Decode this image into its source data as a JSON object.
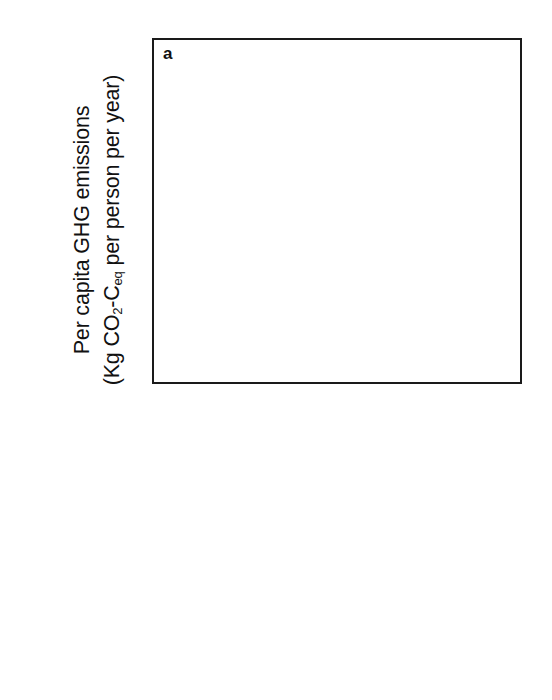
{
  "chart_data": {
    "type": "bar",
    "variant": "stacked",
    "panel_label": "a",
    "title": "",
    "xlabel": "",
    "ylabel_line1": "Per capita GHG emissions",
    "ylabel_line2_pre": "(Kg CO",
    "ylabel_line2_sub1": "2",
    "ylabel_line2_mid": "-C",
    "ylabel_line2_sub2": "eq",
    "ylabel_line2_post": " per person per year)",
    "ylabel_full": "Per capita GHG emissions (Kg CO2-Ceq per person per year)",
    "ylim": [
      0,
      450
    ],
    "yticks": [
      0,
      100,
      200,
      300,
      400
    ],
    "ytick_labels": [
      "0",
      "100",
      "200",
      "300",
      "400"
    ],
    "grid": false,
    "legend_position": "below-plot",
    "categories": [
      "2009",
      "Income-dependent 2050",
      "Mediterranean",
      "Pescetarian",
      "Vegetarian"
    ],
    "series": [
      {
        "name": "Empty calories",
        "color": "#6b6b6b",
        "values": [
          28,
          52,
          25,
          26,
          27
        ]
      },
      {
        "name": "Cereals",
        "color": "#c9c9c9",
        "values": [
          66,
          55,
          40,
          40,
          42
        ]
      },
      {
        "name": "Fruits/vegetables",
        "color": "#2a2a2a",
        "values": [
          39,
          37,
          70,
          49,
          44
        ]
      },
      {
        "name": "Roots",
        "color": "#848484",
        "values": [
          20,
          0,
          0,
          0,
          0
        ]
      },
      {
        "name": "Nuts/pulses",
        "color": "#d8d8d8",
        "values": [
          20,
          95,
          52,
          0,
          0
        ]
      },
      {
        "name": "Dairy/eggs",
        "color": "#5d5d5d",
        "values": [
          26,
          63,
          50,
          60,
          77
        ]
      },
      {
        "name": "Seafood",
        "color": "#9a9a9a",
        "values": [
          18,
          27,
          41,
          59,
          0
        ]
      },
      {
        "name": "Pork",
        "color": "#6e6e6e",
        "values": [
          0,
          26,
          7,
          0,
          0
        ]
      },
      {
        "name": "Poultry",
        "color": "#b5b5b5",
        "values": [
          0,
          22,
          9,
          0,
          0
        ]
      },
      {
        "name": "Ruminant",
        "color": "#4a4a4a",
        "values": [
          116,
          68,
          17,
          0,
          0
        ]
      }
    ],
    "totals": [
      333,
      445,
      311,
      234,
      190
    ]
  },
  "legend": {
    "columns": [
      [
        {
          "label": "Ruminant",
          "color": "#4a4a4a",
          "swatch_name": "legend-swatch-ruminant"
        },
        {
          "label": "Poultry",
          "color": "#b5b5b5",
          "swatch_name": "legend-swatch-poultry"
        },
        {
          "label": "Pork",
          "color": "#6e6e6e",
          "swatch_name": "legend-swatch-pork"
        },
        {
          "label": "Seafood",
          "color": "#9a9a9a",
          "swatch_name": "legend-swatch-seafood"
        },
        {
          "label": "Dairy/eggs",
          "color": "#5d5d5d",
          "swatch_name": "legend-swatch-dairy-eggs"
        }
      ],
      [
        {
          "label": "Fruits/vegetables",
          "color": "#2a2a2a",
          "swatch_name": "legend-swatch-fruits-vegetables"
        },
        {
          "label": "Nuts/pulses",
          "color": "#d8d8d8",
          "swatch_name": "legend-swatch-nuts-pulses"
        },
        {
          "label": "Roots",
          "color": "#848484",
          "swatch_name": "legend-swatch-roots"
        },
        {
          "label": "Cereals",
          "color": "#c9c9c9",
          "swatch_name": "legend-swatch-cereals"
        },
        {
          "label": "Empty calories",
          "color": "#6b6b6b",
          "swatch_name": "legend-swatch-empty-calories"
        }
      ]
    ]
  },
  "axis_style": {
    "frame_color": "#1a1a1a",
    "minor_ticks_per_interval": 5
  }
}
